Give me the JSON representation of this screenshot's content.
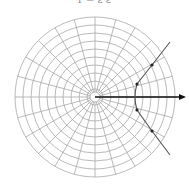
{
  "caption": "r = ε·ε",
  "diagram": {
    "type": "polar-grid-with-hyperbola",
    "center": [
      95,
      97
    ],
    "rings": 10,
    "ring_spacing": 8,
    "inner_ring_radius": 5,
    "spokes": 24,
    "grid_color": "#a8a8a8",
    "curve_color": "#555555",
    "axis_color": "#111111",
    "axis_end": [
      186,
      97
    ],
    "hyperbola_vertex": [
      135,
      97
    ],
    "upper_branch": [
      [
        135,
        97
      ],
      [
        137,
        84
      ],
      [
        152,
        65
      ],
      [
        170,
        42
      ]
    ],
    "lower_branch": [
      [
        135,
        97
      ],
      [
        137,
        110
      ],
      [
        152,
        131
      ],
      [
        170,
        155
      ]
    ],
    "points": [
      [
        137,
        84
      ],
      [
        152,
        65
      ],
      [
        137,
        110
      ],
      [
        152,
        131
      ]
    ]
  }
}
